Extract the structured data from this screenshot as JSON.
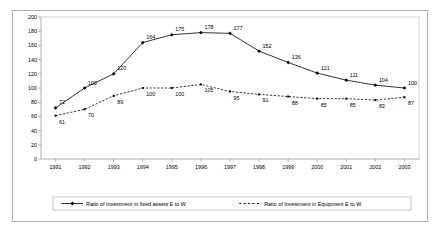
{
  "chart_data": {
    "type": "line",
    "title": "",
    "xlabel": "",
    "ylabel": "",
    "categories": [
      "1991",
      "1992",
      "1993",
      "1994",
      "1995",
      "1996",
      "1997",
      "1998",
      "1999",
      "2000",
      "2001",
      "2002",
      "2003"
    ],
    "ylim": [
      0,
      200
    ],
    "yticks": [
      0,
      20,
      40,
      60,
      80,
      100,
      120,
      140,
      160,
      180,
      200
    ],
    "grid": false,
    "legend_position": "bottom",
    "series": [
      {
        "name": "Ratio of Investment in fixed assets E to W",
        "style": "solid",
        "marker": "diamond",
        "color": "#000000",
        "values": [
          72,
          100,
          120,
          164,
          175,
          178,
          177,
          152,
          136,
          121,
          111,
          104,
          100
        ]
      },
      {
        "name": "Ratio of Investment in Equipment E to W",
        "style": "dotted",
        "marker": "square",
        "color": "#000000",
        "values": [
          61,
          70,
          89,
          100,
          100,
          105,
          95,
          91,
          88,
          85,
          85,
          83,
          87
        ]
      }
    ]
  },
  "legend": {
    "items": [
      {
        "label": "Ratio of Investment in fixed assets E to W"
      },
      {
        "label": "Ratio of Investment in Equipment E to W"
      }
    ]
  },
  "axis": {
    "y_ticks": [
      "200",
      "180",
      "160",
      "140",
      "120",
      "100",
      "80",
      "60",
      "40",
      "20",
      "0"
    ],
    "x_ticks": [
      "1991",
      "1992",
      "1993",
      "1994",
      "1995",
      "1996",
      "1997",
      "1998",
      "1999",
      "2000",
      "2001",
      "2002",
      "2003"
    ]
  },
  "colors": {
    "frame": "#b0b0b0",
    "axis": "#808080",
    "series": "#000000",
    "background": "#ffffff"
  }
}
